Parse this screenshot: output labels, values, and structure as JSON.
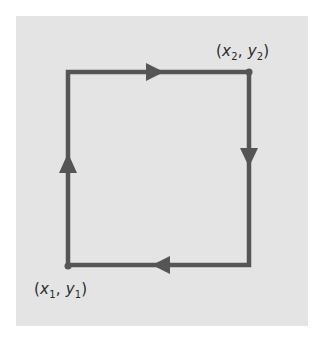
{
  "diagram": {
    "colors": {
      "background": "#ffffff",
      "panel": "#e4e4e4",
      "path": "#555555",
      "text": "#2a2a2a"
    },
    "path": {
      "shape": "rectangle",
      "direction": "clockwise",
      "corners": {
        "top_left": [
          68,
          72
        ],
        "top_right": [
          249,
          72
        ],
        "bottom_right": [
          249,
          265
        ],
        "bottom_left": [
          68,
          265
        ]
      },
      "arrows": [
        {
          "edge": "top",
          "direction": "right"
        },
        {
          "edge": "right",
          "direction": "down"
        },
        {
          "edge": "bottom",
          "direction": "left"
        },
        {
          "edge": "left",
          "direction": "up"
        }
      ]
    },
    "points": [
      {
        "id": "p1",
        "label_open": "(",
        "x_var": "x",
        "x_sub": "1",
        "separator": ", ",
        "y_var": "y",
        "y_sub": "1",
        "label_close": ")",
        "position": "bottom-left"
      },
      {
        "id": "p2",
        "label_open": "(",
        "x_var": "x",
        "x_sub": "2",
        "separator": ", ",
        "y_var": "y",
        "y_sub": "2",
        "label_close": ")",
        "position": "top-right"
      }
    ]
  }
}
